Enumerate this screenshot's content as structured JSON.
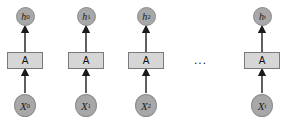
{
  "diagram": {
    "cell_label": "A",
    "ellipsis": "...",
    "columns": [
      {
        "cx": 25,
        "output": {
          "base": "h",
          "sub": "0"
        },
        "input": {
          "base": "X",
          "sub": "0"
        }
      },
      {
        "cx": 86,
        "output": {
          "base": "h",
          "sub": "1"
        },
        "input": {
          "base": "X",
          "sub": "1"
        }
      },
      {
        "cx": 146,
        "output": {
          "base": "h",
          "sub": "2"
        },
        "input": {
          "base": "X",
          "sub": "2"
        }
      },
      {
        "cx": 262,
        "output": {
          "base": "h",
          "sub": "t"
        },
        "input": {
          "base": "X",
          "sub": "t"
        }
      }
    ],
    "colors": {
      "node_fill": "#a8a8a8",
      "cell_fill": "#d6d6d6",
      "arrow": "#1a1a1a"
    }
  }
}
